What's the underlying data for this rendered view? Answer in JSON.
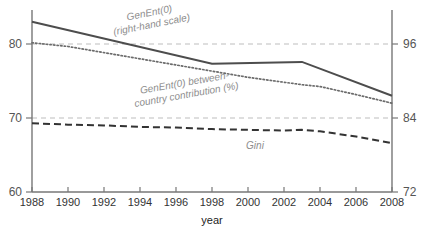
{
  "chart_data": {
    "type": "line",
    "title": "",
    "xlabel": "year",
    "ylabel": "",
    "grid": true,
    "legend_position": "inline-annotations",
    "x": [
      1988,
      1990,
      1992,
      1994,
      1996,
      1998,
      2000,
      2002,
      2003,
      2004,
      2006,
      2008
    ],
    "xlim": [
      1988,
      2008
    ],
    "left_axis": {
      "label": "",
      "ylim": [
        60,
        80
      ],
      "ticks": [
        60,
        70,
        80
      ],
      "tick_labels": [
        "60",
        "70",
        "80"
      ]
    },
    "right_axis": {
      "label": "",
      "ylim": [
        72,
        96
      ],
      "ticks": [
        72,
        84,
        96
      ],
      "tick_labels": [
        "72",
        "84",
        "96"
      ]
    },
    "x_tick_labels": [
      "1988",
      "1990",
      "1992",
      "1994",
      "1996",
      "1998",
      "2000",
      "2002",
      "2004",
      "2006",
      "2008"
    ],
    "series": [
      {
        "name": "GenEnt(0)",
        "axis": "right",
        "style": "solid",
        "color": "#4d4d4d",
        "x": [
          1988,
          1998,
          2003,
          2008
        ],
        "values": [
          99.6,
          92.8,
          93.1,
          87.6
        ]
      },
      {
        "name": "GenEnt(0) between-country contribution (%)",
        "axis": "right",
        "style": "dotted",
        "color": "#6b6b6b",
        "x": [
          1988,
          1990,
          1992,
          1994,
          1996,
          1998,
          2000,
          2002,
          2003,
          2004,
          2006,
          2008
        ],
        "values": [
          96.2,
          95.6,
          94.6,
          93.6,
          92.6,
          91.6,
          90.6,
          89.8,
          89.4,
          89.1,
          87.8,
          86.4
        ]
      },
      {
        "name": "Gini",
        "axis": "left",
        "style": "dashed",
        "color": "#333333",
        "x": [
          1988,
          1990,
          1992,
          1994,
          1996,
          1998,
          2000,
          2002,
          2003,
          2004,
          2006,
          2008
        ],
        "values": [
          69.3,
          69.1,
          69.0,
          68.8,
          68.7,
          68.5,
          68.4,
          68.3,
          68.4,
          68.2,
          67.5,
          66.6
        ]
      }
    ],
    "annotations": [
      {
        "id": "genent-label",
        "line1": "GenEnt(0)",
        "line2": "(right-hand scale)"
      },
      {
        "id": "between-country-label",
        "line1": "GenEnt(0) between-",
        "line2": "country contribution (%)"
      },
      {
        "id": "gini-label",
        "line1": "Gini",
        "line2": ""
      }
    ]
  },
  "axis": {
    "x_title": "year",
    "ticks_left": [
      "80",
      "70",
      "60"
    ],
    "ticks_right": [
      "96",
      "84",
      "72"
    ],
    "ticks_x": [
      "1988",
      "1990",
      "1992",
      "1994",
      "1996",
      "1998",
      "2000",
      "2002",
      "2004",
      "2006",
      "2008"
    ]
  },
  "annotations": {
    "genent": {
      "line1": "GenEnt(0)",
      "line2": "(right-hand scale)"
    },
    "between": {
      "line1": "GenEnt(0) between-",
      "line2": "country contribution (%)"
    },
    "gini": {
      "label": "Gini"
    }
  },
  "colors": {
    "solid_line": "#4d4d4d",
    "dotted_line": "#6b6b6b",
    "dashed_line": "#333333",
    "gridline": "#bdbdbd",
    "axis": "#777777",
    "annotation_text": "#8d8d8d"
  }
}
